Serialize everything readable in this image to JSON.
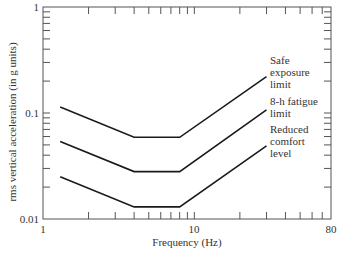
{
  "chart_data": {
    "type": "line",
    "title": "",
    "xlabel": "Frequency (Hz)",
    "ylabel": "rms vertical acceleration (in g units)",
    "xscale": "log",
    "yscale": "log",
    "xlim": [
      1,
      80
    ],
    "ylim": [
      0.01,
      1
    ],
    "x_tick_labels": [
      "1",
      "10",
      "80"
    ],
    "y_tick_labels": [
      "0.01",
      "0.1",
      "1"
    ],
    "grid": false,
    "legend": "none (direct labels at right end of curves)",
    "series": [
      {
        "name": "Safe exposure limit",
        "label_lines": [
          "Safe",
          "exposure",
          "limit"
        ],
        "x": [
          1.3,
          4,
          8,
          30
        ],
        "y": [
          0.114,
          0.059,
          0.059,
          0.22
        ]
      },
      {
        "name": "8-h fatigue limit",
        "label_lines": [
          "8-h fatigue",
          "limit"
        ],
        "x": [
          1.3,
          4,
          8,
          30
        ],
        "y": [
          0.054,
          0.028,
          0.028,
          0.107
        ]
      },
      {
        "name": "Reduced comfort level",
        "label_lines": [
          "Reduced",
          "comfort",
          "level"
        ],
        "x": [
          1.3,
          4,
          8,
          30
        ],
        "y": [
          0.025,
          0.013,
          0.013,
          0.049
        ]
      }
    ]
  },
  "colors": {
    "line": "#1a1a1a",
    "axis": "#444444",
    "text": "#333333"
  }
}
